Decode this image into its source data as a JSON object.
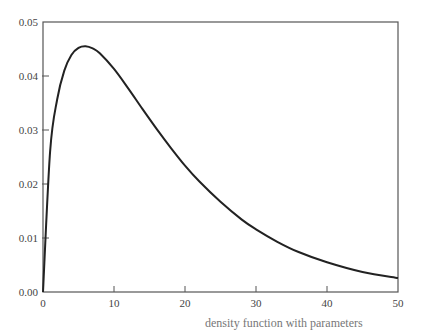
{
  "chart_data": {
    "type": "line",
    "title": "",
    "xlabel": "",
    "ylabel": "",
    "xlim": [
      0,
      50
    ],
    "ylim": [
      0,
      0.05
    ],
    "x_ticks": [
      "0",
      "10",
      "20",
      "30",
      "40",
      "50"
    ],
    "y_ticks": [
      "0.00",
      "0.01",
      "0.02",
      "0.03",
      "0.04",
      "0.05"
    ],
    "grid": false,
    "legend": null,
    "series": [
      {
        "name": "density",
        "x": [
          0,
          1,
          2,
          3,
          4,
          5,
          6,
          7,
          8,
          10,
          12,
          14,
          16,
          18,
          20,
          22,
          25,
          28,
          30,
          33,
          36,
          40,
          45,
          50
        ],
        "y": [
          0.0,
          0.026,
          0.0357,
          0.041,
          0.0439,
          0.0452,
          0.0455,
          0.0451,
          0.0442,
          0.0413,
          0.0377,
          0.0339,
          0.0302,
          0.0267,
          0.0234,
          0.0205,
          0.0167,
          0.0134,
          0.0116,
          0.0093,
          0.0074,
          0.0055,
          0.0037,
          0.0026
        ]
      }
    ],
    "caption_partial": "density function with parameters"
  },
  "caption": "density function with parameters"
}
